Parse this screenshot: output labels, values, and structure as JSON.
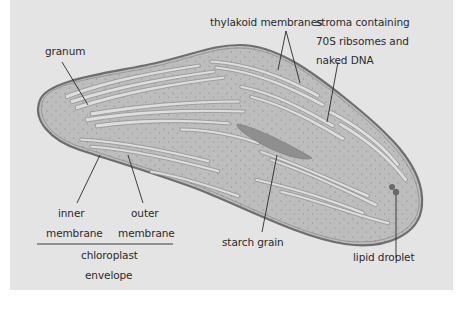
{
  "diagram": {
    "subject": "chloroplast",
    "colors": {
      "background_panel": "#e4e4e4",
      "stroma_fill": "#bdbdbd",
      "envelope_stroke": "#6e6e6e",
      "thylakoid_stroke": "#8a8a8a",
      "thylakoid_fill": "#dedede",
      "starch_fill": "#8f8f8f",
      "lipid_fill": "#6a6a6a",
      "leader_line": "#2a2a2a"
    },
    "labels": {
      "granum": "granum",
      "thylakoid": "thylakoid membranes",
      "stroma_line1": "stroma containing",
      "stroma_line2": "70S ribsomes and",
      "stroma_line3": "naked DNA",
      "inner_line1": "inner",
      "inner_line2": "membrane",
      "outer_line1": "outer",
      "outer_line2": "membrane",
      "envelope_line1": "chloroplast",
      "envelope_line2": "envelope",
      "starch": "starch grain",
      "lipid": "lipid droplet"
    }
  }
}
